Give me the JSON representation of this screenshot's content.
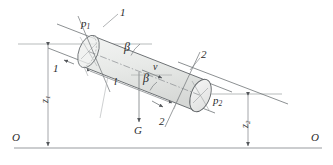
{
  "figure": {
    "type": "engineering-diagram",
    "background_color": "#ffffff",
    "ink_color": "#55585c",
    "cylinder_fill": "#e9ebe9",
    "cylinder_fill_dark": "#dcdedc",
    "cap_fill": "#f0f1f0",
    "label_color": "#2b2b2b"
  },
  "labels": {
    "pressure_in": "p",
    "pressure_in_sub": "1",
    "pressure_out": "p",
    "pressure_out_sub": "2",
    "section_top": "1",
    "section_left": "1",
    "section_right": "2",
    "section_bottom": "2",
    "angle_upper": "β",
    "angle_lower": "β",
    "velocity": "v",
    "weight": "G",
    "length": "l",
    "elevation_left": "z",
    "elevation_left_sub": "1",
    "elevation_right": "z",
    "elevation_right_sub": "2",
    "datum_left": "O",
    "datum_right": "O"
  },
  "geometry": {
    "datum_line_y": 148,
    "upper_reference_line_y": 44,
    "lower_reference_line_y": 94,
    "dim_left_x": 48,
    "dim_right_x": 248,
    "pipe_angle_deg": 21,
    "axis_start": [
      93,
      53
    ],
    "axis_end": [
      210,
      98
    ]
  }
}
